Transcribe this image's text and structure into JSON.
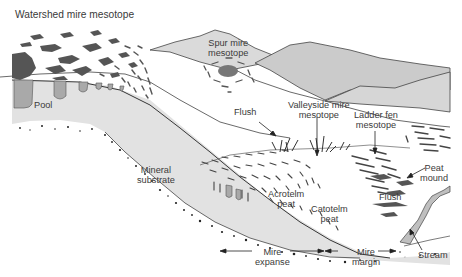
{
  "diagram": {
    "title": "Watershed mire mesotope",
    "labels": {
      "spur": [
        "Spur mire",
        "mesotope"
      ],
      "pool": "Pool",
      "flush_upper": "Flush",
      "valleyside": [
        "Valleyside mire",
        "mesotope"
      ],
      "ladder_fen": [
        "Ladder fen",
        "mesotope"
      ],
      "mineral": [
        "Mineral",
        "substrate"
      ],
      "peat_mound": [
        "Peat",
        "mound"
      ],
      "acrotelm": [
        "Acrotelm",
        "peat"
      ],
      "catotelm": [
        "Catotelm",
        "peat"
      ],
      "flush_lower": "Flush",
      "stream": "Stream",
      "mire_expanse": [
        "Mire",
        "expanse"
      ],
      "mire_margin": [
        "Mire",
        "margin"
      ]
    },
    "colors": {
      "peat": "#e2e2e2",
      "hill_light": "#dcdcdc",
      "hill_mid": "#cfcfcf",
      "hill_dark": "#c4c4c4",
      "pool": "#a9a9a9",
      "vegetation": "#555555",
      "outline": "#333333",
      "text": "#3a3a3a"
    }
  }
}
